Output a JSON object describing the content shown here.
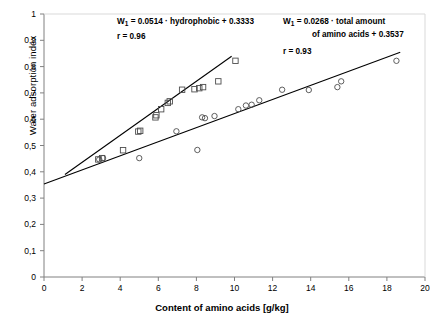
{
  "chart_data": {
    "type": "scatter",
    "title": "",
    "xlabel": "Content of amino acids [g/kg]",
    "ylabel": "Water adsorption index",
    "xlim": [
      0,
      20
    ],
    "ylim": [
      0,
      1
    ],
    "xticks": [
      "0",
      "2",
      "4",
      "6",
      "8",
      "10",
      "12",
      "14",
      "16",
      "18",
      "20"
    ],
    "yticks": [
      "0",
      "0,1",
      "0,2",
      "0,3",
      "0,4",
      "0,5",
      "0,6",
      "0,7",
      "0,8",
      "0,9",
      "1"
    ],
    "grid": false,
    "legend_position": "none",
    "series": [
      {
        "name": "hydrophobic amino acids",
        "marker": "square",
        "points": [
          [
            2.85,
            0.447
          ],
          [
            3.05,
            0.452
          ],
          [
            4.15,
            0.482
          ],
          [
            4.95,
            0.553
          ],
          [
            5.05,
            0.556
          ],
          [
            5.85,
            0.607
          ],
          [
            5.9,
            0.615
          ],
          [
            6.15,
            0.638
          ],
          [
            6.5,
            0.662
          ],
          [
            6.6,
            0.668
          ],
          [
            7.25,
            0.712
          ],
          [
            7.9,
            0.714
          ],
          [
            8.15,
            0.718
          ],
          [
            8.35,
            0.722
          ],
          [
            9.15,
            0.744
          ],
          [
            10.05,
            0.822
          ]
        ]
      },
      {
        "name": "total amount of amino acids",
        "marker": "circle",
        "points": [
          [
            2.9,
            0.447
          ],
          [
            3.1,
            0.452
          ],
          [
            5.0,
            0.452
          ],
          [
            6.95,
            0.554
          ],
          [
            8.05,
            0.483
          ],
          [
            8.3,
            0.607
          ],
          [
            8.45,
            0.604
          ],
          [
            8.95,
            0.612
          ],
          [
            10.2,
            0.638
          ],
          [
            10.6,
            0.652
          ],
          [
            10.9,
            0.655
          ],
          [
            11.3,
            0.672
          ],
          [
            12.5,
            0.712
          ],
          [
            13.9,
            0.711
          ],
          [
            15.4,
            0.722
          ],
          [
            15.6,
            0.744
          ],
          [
            18.5,
            0.822
          ]
        ]
      }
    ],
    "fits": [
      {
        "name": "hydrophobic-fit-line",
        "slope": 0.0514,
        "intercept": 0.3333,
        "x_from": 1.1,
        "x_to": 9.85
      },
      {
        "name": "total-amino-acids-fit-line",
        "slope": 0.0268,
        "intercept": 0.3537,
        "x_from": 0.0,
        "x_to": 18.7
      }
    ],
    "annotations": {
      "eq1_line1_prefix": "W",
      "eq1_line1_sub": "1",
      "eq1_line1_rest": " = 0.0514 · hydrophobic + 0.3333",
      "eq1_line2": "r = 0.96",
      "eq2_line1_prefix": "W",
      "eq2_line1_sub": "1",
      "eq2_line1_rest": " = 0.0268 · total amount",
      "eq2_line2": "of amino acids + 0.3537",
      "eq2_line3": "r = 0.93"
    }
  }
}
